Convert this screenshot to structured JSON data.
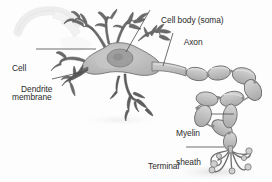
{
  "figure": {
    "style": "grayscale-line-drawing",
    "background_color": "#fdfdfd",
    "ink_color": "#4a4a4a",
    "text_color": "#2b2b2b",
    "soma_fill": "#b9b9b9",
    "nucleus_fill": "#9c9c9c",
    "myelin_fill": "#c2c2c2",
    "dendrite_fill": "#6e6e6e",
    "ghost_fill": "#efefef"
  },
  "labels": {
    "cell_body": "Cell body (soma)",
    "axon": "Axon",
    "cell_membrane_line1": "Cell",
    "cell_membrane_line2": "membrane",
    "dendrite": "Dendrite",
    "myelin_line1": "Myelin",
    "myelin_line2": "sheath",
    "terminal_line1": "Terminal",
    "terminal_line2": "buttons"
  }
}
